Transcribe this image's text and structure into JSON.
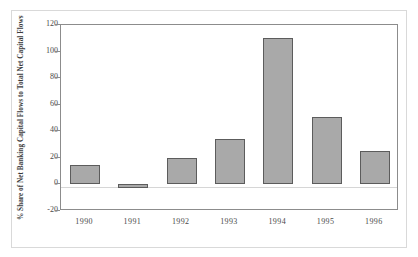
{
  "chart_data": {
    "type": "bar",
    "title": "",
    "xlabel": "",
    "ylabel": "% Share of Net Banking Capital Flows to Total Net Capital Flows",
    "categories": [
      "1990",
      "1991",
      "1992",
      "1993",
      "1994",
      "1995",
      "1996"
    ],
    "values": [
      15,
      -3,
      20,
      34,
      110,
      51,
      25
    ],
    "ylim": [
      -20,
      120
    ],
    "ytick_values": [
      120,
      100,
      80,
      60,
      40,
      20,
      0,
      -20
    ],
    "ytick_labels": [
      "120",
      "100",
      "80",
      "60",
      "40",
      "20",
      "0",
      "-20"
    ],
    "grid": false,
    "legend": null,
    "legend_position": "none",
    "series": [
      {
        "name": "Net Banking Capital Flows Share",
        "values": [
          15,
          -3,
          20,
          34,
          110,
          51,
          25
        ]
      }
    ],
    "bar_fill_color": "#a9a9a9",
    "bar_border_color": "#5c5c5c",
    "axis_color": "#8c8c8c",
    "zero_line_color": "#d6d6d6",
    "background_color": "#ffffff"
  }
}
